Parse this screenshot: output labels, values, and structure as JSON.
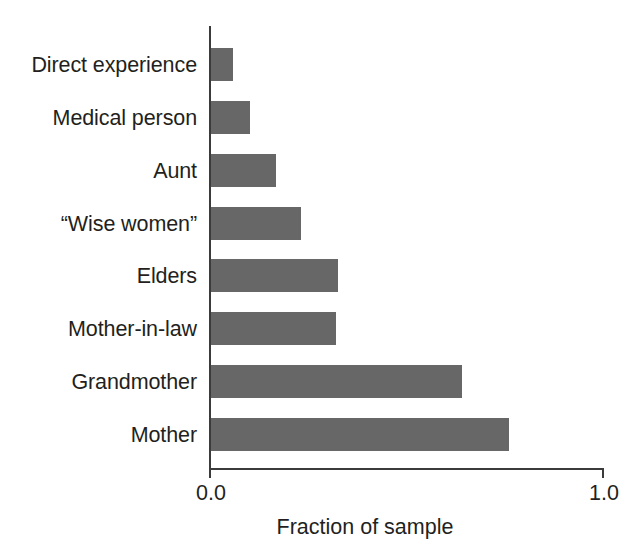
{
  "chart_data": {
    "type": "bar",
    "orientation": "horizontal",
    "title": "",
    "subtitle": "",
    "xlabel": "Fraction of sample",
    "ylabel": "",
    "categories": [
      "Direct experience",
      "Medical person",
      "Aunt",
      "“Wise women”",
      "Elders",
      "Mother-in-law",
      "Grandmother",
      "Mother"
    ],
    "values": [
      0.055,
      0.1,
      0.165,
      0.23,
      0.325,
      0.32,
      0.64,
      0.76
    ],
    "xlim": [
      0.0,
      1.0
    ],
    "xticks": [
      0.0,
      1.0
    ],
    "xtick_labels": [
      "0.0",
      "1.0"
    ],
    "grid": false,
    "legend": false,
    "bar_color": "#676767",
    "axis_color": "#3b3b3b",
    "text_color": "#231f20",
    "background": "#ffffff"
  },
  "axis": {
    "tick_left": "0.0",
    "tick_right": "1.0",
    "title": "Fraction of sample"
  },
  "bars": [
    {
      "label": "Direct experience",
      "value": 0.055
    },
    {
      "label": "Medical person",
      "value": 0.1
    },
    {
      "label": "Aunt",
      "value": 0.165
    },
    {
      "label": "“Wise women”",
      "value": 0.23
    },
    {
      "label": "Elders",
      "value": 0.325
    },
    {
      "label": "Mother-in-law",
      "value": 0.32
    },
    {
      "label": "Grandmother",
      "value": 0.64
    },
    {
      "label": "Mother",
      "value": 0.76
    }
  ]
}
